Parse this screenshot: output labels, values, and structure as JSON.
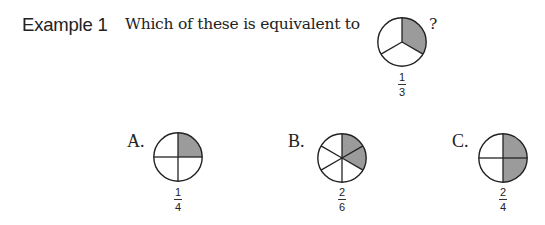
{
  "header": {
    "example_label": "Example 1",
    "question": "Which of these is equivalent to",
    "question_mark": "?"
  },
  "reference": {
    "parts": 3,
    "shaded_parts": 1,
    "fraction": {
      "numerator": "1",
      "denominator": "3"
    }
  },
  "options": [
    {
      "letter": "A.",
      "parts": 4,
      "shaded_parts": 1,
      "fraction": {
        "numerator": "1",
        "denominator": "4"
      }
    },
    {
      "letter": "B.",
      "parts": 6,
      "shaded_parts": 2,
      "fraction": {
        "numerator": "2",
        "denominator": "6"
      }
    },
    {
      "letter": "C.",
      "parts": 4,
      "shaded_parts": 2,
      "fraction": {
        "numerator": "2",
        "denominator": "4"
      }
    }
  ],
  "colors": {
    "shade": "#9b9b9b",
    "line": "#222222",
    "fill": "#ffffff"
  }
}
